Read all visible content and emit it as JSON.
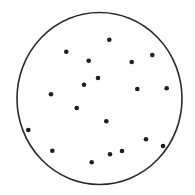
{
  "diagram": {
    "type": "dot-scatter-in-circle",
    "colors": {
      "background": "#ffffff",
      "outline": "#2a2a2a",
      "dot": "#1e1e1e"
    },
    "circle": {
      "cx": 99.5,
      "cy": 98.5,
      "rx": 82.5,
      "ry": 86,
      "stroke_width": 1.6
    },
    "dot_radius": 2.3,
    "dot_count": 19,
    "dots": [
      {
        "x": 109.3,
        "y": 39.7
      },
      {
        "x": 66.3,
        "y": 51.7
      },
      {
        "x": 88.7,
        "y": 60.7
      },
      {
        "x": 131.7,
        "y": 62.0
      },
      {
        "x": 152.3,
        "y": 55.0
      },
      {
        "x": 98.0,
        "y": 78.0
      },
      {
        "x": 84.0,
        "y": 84.7
      },
      {
        "x": 51.0,
        "y": 94.3
      },
      {
        "x": 137.3,
        "y": 89.0
      },
      {
        "x": 166.7,
        "y": 88.3
      },
      {
        "x": 76.7,
        "y": 108.0
      },
      {
        "x": 106.3,
        "y": 121.3
      },
      {
        "x": 28.3,
        "y": 130.0
      },
      {
        "x": 146.0,
        "y": 139.3
      },
      {
        "x": 163.0,
        "y": 146.0
      },
      {
        "x": 52.3,
        "y": 150.7
      },
      {
        "x": 110.0,
        "y": 154.3
      },
      {
        "x": 122.0,
        "y": 151.0
      },
      {
        "x": 91.7,
        "y": 162.3
      }
    ]
  }
}
